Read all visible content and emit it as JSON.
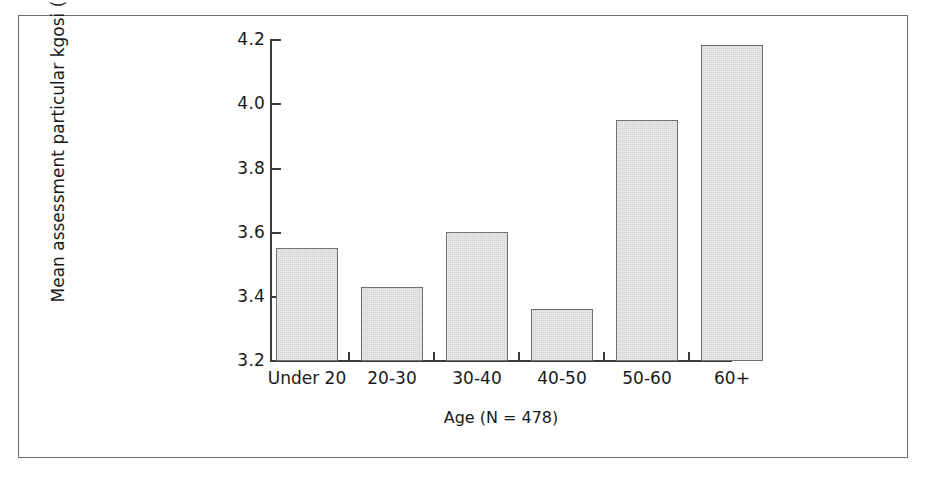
{
  "chart_data": {
    "type": "bar",
    "title": "",
    "categories": [
      "Under 20",
      "20-30",
      "30-40",
      "40-50",
      "50-60",
      "60+"
    ],
    "values": [
      3.55,
      3.43,
      3.6,
      3.36,
      3.95,
      4.18
    ],
    "xlabel": "Age (N = 478)",
    "ylabel": "Mean assessment particular kgosi (1-5)",
    "ylim": [
      3.2,
      4.2
    ],
    "yticks": [
      "3.2",
      "3.4",
      "3.6",
      "3.8",
      "4.0",
      "4.2"
    ],
    "ytick_values": [
      3.2,
      3.4,
      3.6,
      3.8,
      4.0,
      4.2
    ],
    "grid": false,
    "legend": false,
    "bar_fill_color": "#d3d3d3",
    "bar_edge_color": "#6f6f6f",
    "axis_color": "#3a3a3a",
    "frame_color": "#6d6d6d",
    "background_color": "#ffffff"
  }
}
